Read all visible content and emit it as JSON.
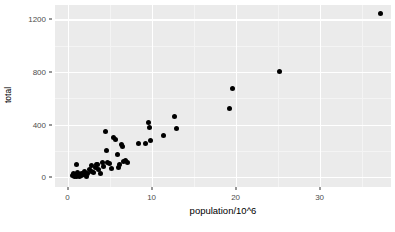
{
  "chart_data": {
    "type": "scatter",
    "title": "",
    "xlabel": "population/10^6",
    "ylabel": "total",
    "xlim": [
      -1.5,
      38.5
    ],
    "ylim": [
      -75,
      1310
    ],
    "xticks": [
      0,
      10,
      20,
      30
    ],
    "xtick_labels": [
      "0",
      "10",
      "20",
      "30"
    ],
    "yticks": [
      0,
      400,
      800,
      1200
    ],
    "ytick_labels": [
      "0",
      "400",
      "800",
      "1200"
    ],
    "x_minor_ticks": [
      5,
      15,
      25,
      35
    ],
    "y_minor_ticks": [
      200,
      600,
      1000
    ],
    "grid": true,
    "legend": "none",
    "point_color": "#000000",
    "panel_color": "#ebebeb",
    "grid_color": "#ffffff",
    "points": [
      {
        "x": 0.6,
        "y": 12
      },
      {
        "x": 0.7,
        "y": 30
      },
      {
        "x": 0.8,
        "y": 5
      },
      {
        "x": 0.9,
        "y": 20
      },
      {
        "x": 1.0,
        "y": 100
      },
      {
        "x": 1.1,
        "y": 8
      },
      {
        "x": 1.2,
        "y": 38
      },
      {
        "x": 1.3,
        "y": 15
      },
      {
        "x": 1.4,
        "y": 5
      },
      {
        "x": 1.6,
        "y": 25
      },
      {
        "x": 1.7,
        "y": 10
      },
      {
        "x": 1.9,
        "y": 18
      },
      {
        "x": 2.0,
        "y": 45
      },
      {
        "x": 2.2,
        "y": 8
      },
      {
        "x": 2.4,
        "y": 30
      },
      {
        "x": 2.6,
        "y": 60
      },
      {
        "x": 2.8,
        "y": 42
      },
      {
        "x": 2.9,
        "y": 88
      },
      {
        "x": 3.1,
        "y": 35
      },
      {
        "x": 3.3,
        "y": 70
      },
      {
        "x": 3.4,
        "y": 95
      },
      {
        "x": 3.6,
        "y": 100
      },
      {
        "x": 3.7,
        "y": 55
      },
      {
        "x": 3.9,
        "y": 30
      },
      {
        "x": 4.1,
        "y": 110
      },
      {
        "x": 4.3,
        "y": 80
      },
      {
        "x": 4.5,
        "y": 350
      },
      {
        "x": 4.6,
        "y": 205
      },
      {
        "x": 4.8,
        "y": 115
      },
      {
        "x": 5.0,
        "y": 105
      },
      {
        "x": 5.2,
        "y": 62
      },
      {
        "x": 5.5,
        "y": 300
      },
      {
        "x": 5.7,
        "y": 285
      },
      {
        "x": 5.9,
        "y": 170
      },
      {
        "x": 6.0,
        "y": 75
      },
      {
        "x": 6.2,
        "y": 95
      },
      {
        "x": 6.4,
        "y": 245
      },
      {
        "x": 6.5,
        "y": 235
      },
      {
        "x": 6.7,
        "y": 118
      },
      {
        "x": 6.9,
        "y": 125
      },
      {
        "x": 7.1,
        "y": 108
      },
      {
        "x": 8.4,
        "y": 255
      },
      {
        "x": 9.3,
        "y": 255
      },
      {
        "x": 9.6,
        "y": 415
      },
      {
        "x": 9.7,
        "y": 380
      },
      {
        "x": 9.9,
        "y": 282
      },
      {
        "x": 11.4,
        "y": 315
      },
      {
        "x": 12.7,
        "y": 460
      },
      {
        "x": 13.0,
        "y": 370
      },
      {
        "x": 19.3,
        "y": 520
      },
      {
        "x": 19.6,
        "y": 675
      },
      {
        "x": 25.2,
        "y": 805
      },
      {
        "x": 37.3,
        "y": 1245
      }
    ]
  }
}
